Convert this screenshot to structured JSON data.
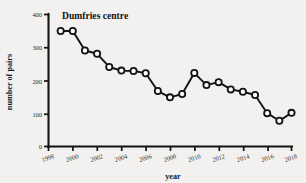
{
  "chart_data": {
    "type": "line",
    "title": "Dumfries centre",
    "xlabel": "year",
    "ylabel": "number of pairs",
    "xlim": [
      1998,
      2018
    ],
    "ylim": [
      0,
      400
    ],
    "xticks": [
      1998,
      2000,
      2002,
      2004,
      2006,
      2008,
      2010,
      2012,
      2014,
      2016,
      2018
    ],
    "yticks": [
      0,
      100,
      200,
      300,
      400
    ],
    "grid": false,
    "legend": "none",
    "marker": "open-circle",
    "x": [
      1999,
      2000,
      2001,
      2002,
      2003,
      2004,
      2005,
      2006,
      2007,
      2008,
      2009,
      2010,
      2011,
      2012,
      2013,
      2014,
      2015,
      2016,
      2017,
      2018
    ],
    "values": [
      350,
      350,
      291,
      281,
      241,
      230,
      229,
      222,
      168,
      149,
      159,
      223,
      186,
      195,
      173,
      166,
      156,
      101,
      78,
      102
    ],
    "series": [
      {
        "name": "Dumfries centre",
        "values": [
          350,
          350,
          291,
          281,
          241,
          230,
          229,
          222,
          168,
          149,
          159,
          223,
          186,
          195,
          173,
          166,
          156,
          101,
          78,
          102
        ]
      }
    ]
  },
  "axis": {
    "y_label": "number of pairs",
    "x_label": "year",
    "y_tick_labels": [
      "0",
      "100",
      "200",
      "300",
      "400"
    ],
    "x_tick_labels": [
      "1998",
      "2000",
      "2002",
      "2004",
      "2006",
      "2008",
      "2010",
      "2012",
      "2014",
      "2016",
      "2018"
    ]
  },
  "title": "Dumfries centre",
  "colors": {
    "background": "#f2f1ef",
    "ink": "#141311",
    "marker_fill": "#fbfbfa"
  }
}
